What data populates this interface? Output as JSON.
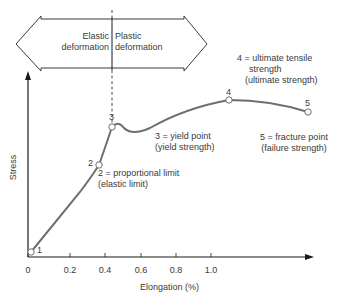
{
  "deformation_band": {
    "elastic_label": [
      "Elastic",
      "deformation"
    ],
    "plastic_label": [
      "Plastic",
      "deformation"
    ]
  },
  "axes": {
    "y_label": "Stress",
    "x_label": "Elongation (%)",
    "x_ticks": [
      "0",
      "0.2",
      "0.4",
      "0.6",
      "0.8",
      "1.0"
    ]
  },
  "points": [
    {
      "id": "1",
      "name": "origin"
    },
    {
      "id": "2",
      "name": "proportional limit"
    },
    {
      "id": "3",
      "name": "yield point"
    },
    {
      "id": "4",
      "name": "ultimate tensile strength"
    },
    {
      "id": "5",
      "name": "fracture point"
    }
  ],
  "annotations": {
    "p2": [
      "2 = proportional limit",
      "(elastic limit)"
    ],
    "p3": [
      "3 = yield point",
      "(yield strength)"
    ],
    "p4": [
      "4 = ultimate tensile",
      "strength",
      "(ultimate strength)"
    ],
    "p5": [
      "5 = fracture point",
      "(failure strength)"
    ]
  },
  "colors": {
    "curve": "#6e6e6e",
    "axis": "#1a1a1a",
    "text": "#3a3a3a"
  }
}
